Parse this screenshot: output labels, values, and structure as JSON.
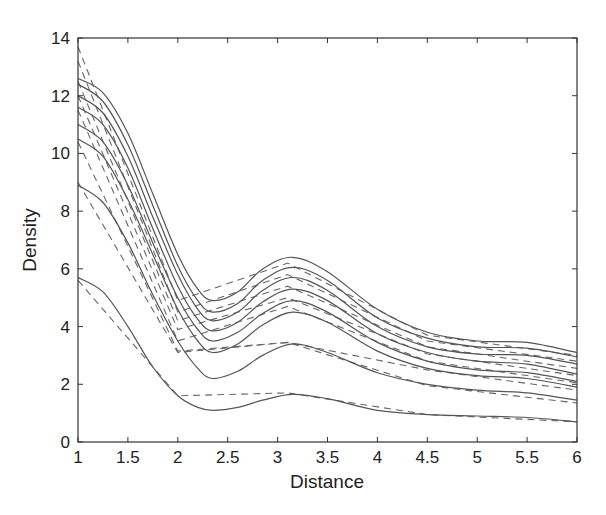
{
  "chart_data": {
    "type": "line",
    "title": "",
    "xlabel": "Distance",
    "ylabel": "Density",
    "xlim": [
      1,
      6
    ],
    "ylim": [
      0,
      14
    ],
    "xticks": [
      1,
      1.5,
      2,
      2.5,
      3,
      3.5,
      4,
      4.5,
      5,
      5.5,
      6
    ],
    "xtick_labels": [
      "1",
      "1.5",
      "2",
      "2.5",
      "3",
      "3.5",
      "4",
      "4.5",
      "5",
      "5.5",
      "6"
    ],
    "yticks": [
      0,
      2,
      4,
      6,
      8,
      10,
      12,
      14
    ],
    "ytick_labels": [
      "0",
      "2",
      "4",
      "6",
      "8",
      "10",
      "12",
      "14"
    ],
    "grid": false,
    "legend": null,
    "solid_series": [
      {
        "name": "solid-1",
        "x": [
          1,
          1.25,
          1.5,
          1.75,
          2,
          2.2,
          2.35,
          2.6,
          2.85,
          3.15,
          3.5,
          4,
          4.5,
          5,
          5.5,
          6
        ],
        "y": [
          12.6,
          12.1,
          10.7,
          8.6,
          6.5,
          5.3,
          4.9,
          5.2,
          6.0,
          6.4,
          5.9,
          4.6,
          3.8,
          3.5,
          3.45,
          3.1
        ]
      },
      {
        "name": "solid-2",
        "x": [
          1,
          1.25,
          1.5,
          1.75,
          2,
          2.2,
          2.35,
          2.6,
          2.85,
          3.15,
          3.5,
          4,
          4.5,
          5,
          5.5,
          6
        ],
        "y": [
          12.4,
          11.8,
          10.3,
          8.2,
          6.1,
          4.9,
          4.5,
          4.8,
          5.6,
          6.05,
          5.6,
          4.3,
          3.6,
          3.3,
          3.25,
          2.95
        ]
      },
      {
        "name": "solid-3",
        "x": [
          1,
          1.25,
          1.5,
          1.75,
          2,
          2.2,
          2.35,
          2.6,
          2.85,
          3.15,
          3.5,
          4,
          4.5,
          5,
          5.5,
          6
        ],
        "y": [
          12.0,
          11.4,
          9.9,
          7.8,
          5.8,
          4.6,
          4.2,
          4.5,
          5.25,
          5.7,
          5.25,
          4.0,
          3.3,
          3.05,
          3.0,
          2.7
        ]
      },
      {
        "name": "solid-4",
        "x": [
          1,
          1.25,
          1.5,
          1.75,
          2,
          2.2,
          2.35,
          2.6,
          2.85,
          3.15,
          3.5,
          4,
          4.5,
          5,
          5.5,
          6
        ],
        "y": [
          11.6,
          11.0,
          9.5,
          7.4,
          5.4,
          4.25,
          3.85,
          4.15,
          4.85,
          5.3,
          4.9,
          3.75,
          3.1,
          2.8,
          2.7,
          2.35
        ]
      },
      {
        "name": "solid-5",
        "x": [
          1,
          1.25,
          1.5,
          1.75,
          2,
          2.2,
          2.35,
          2.6,
          2.85,
          3.15,
          3.5,
          4,
          4.5,
          5,
          5.5,
          6
        ],
        "y": [
          11.0,
          10.4,
          8.9,
          6.9,
          5.0,
          3.9,
          3.5,
          3.8,
          4.45,
          4.9,
          4.5,
          3.45,
          2.8,
          2.5,
          2.4,
          2.1
        ]
      },
      {
        "name": "solid-6",
        "x": [
          1,
          1.25,
          1.5,
          1.75,
          2,
          2.2,
          2.35,
          2.6,
          2.85,
          3.15,
          3.5,
          4,
          4.5,
          5,
          5.5,
          6
        ],
        "y": [
          10.5,
          9.9,
          8.4,
          6.5,
          4.6,
          3.5,
          3.1,
          3.4,
          4.05,
          4.5,
          4.15,
          3.15,
          2.55,
          2.3,
          2.2,
          1.9
        ]
      },
      {
        "name": "solid-7",
        "x": [
          1,
          1.25,
          1.5,
          1.75,
          2,
          2.2,
          2.35,
          2.6,
          2.85,
          3.15,
          3.5,
          4,
          4.5,
          5,
          5.5,
          6
        ],
        "y": [
          8.9,
          8.3,
          6.9,
          5.1,
          3.5,
          2.55,
          2.2,
          2.45,
          3.0,
          3.4,
          3.1,
          2.4,
          2.0,
          1.8,
          1.7,
          1.45
        ]
      },
      {
        "name": "solid-8",
        "x": [
          1,
          1.25,
          1.5,
          1.75,
          2,
          2.2,
          2.35,
          2.6,
          2.85,
          3.15,
          3.5,
          4,
          4.5,
          5,
          5.5,
          6
        ],
        "y": [
          5.7,
          5.2,
          4.0,
          2.6,
          1.6,
          1.2,
          1.1,
          1.2,
          1.45,
          1.65,
          1.5,
          1.1,
          0.95,
          0.9,
          0.85,
          0.7
        ]
      }
    ],
    "dashed_series": [
      {
        "name": "dashed-1",
        "x": [
          1,
          2,
          3.1,
          4.5,
          6
        ],
        "y": [
          13.7,
          4.9,
          6.2,
          3.7,
          3.0
        ]
      },
      {
        "name": "dashed-2",
        "x": [
          1,
          2,
          3.1,
          4.5,
          6
        ],
        "y": [
          13.2,
          4.5,
          5.8,
          3.5,
          2.8
        ]
      },
      {
        "name": "dashed-3",
        "x": [
          1,
          2,
          3.1,
          4.5,
          6
        ],
        "y": [
          12.5,
          4.2,
          5.4,
          3.3,
          2.55
        ]
      },
      {
        "name": "dashed-4",
        "x": [
          1,
          2,
          3.1,
          4.5,
          6
        ],
        "y": [
          12.0,
          3.9,
          5.0,
          3.05,
          2.3
        ]
      },
      {
        "name": "dashed-5",
        "x": [
          1,
          2,
          3.1,
          4.5,
          6
        ],
        "y": [
          11.5,
          3.5,
          4.7,
          2.8,
          2.05
        ]
      },
      {
        "name": "dashed-6",
        "x": [
          1,
          2,
          3.1,
          4.5,
          6
        ],
        "y": [
          10.4,
          3.15,
          3.45,
          2.5,
          1.8
        ]
      },
      {
        "name": "dashed-7",
        "x": [
          1,
          2,
          3.1,
          4.5,
          6
        ],
        "y": [
          9.0,
          3.1,
          3.45,
          1.95,
          1.35
        ]
      },
      {
        "name": "dashed-8",
        "x": [
          1,
          2,
          3.1,
          4.5,
          6
        ],
        "y": [
          5.6,
          1.6,
          1.7,
          0.95,
          0.7
        ]
      }
    ],
    "colors": {
      "solid": "#555555",
      "dashed": "#666666",
      "axis": "#333333"
    }
  }
}
